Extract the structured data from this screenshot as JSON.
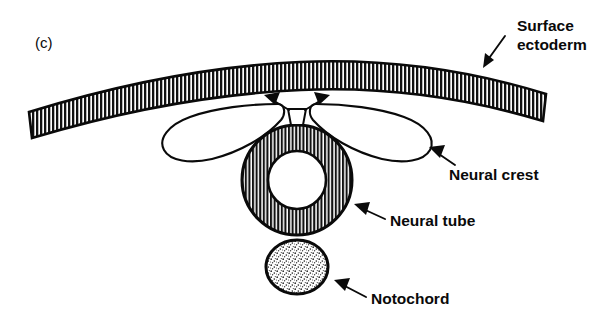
{
  "figure": {
    "panel_label": "(c)",
    "background_color": "#ffffff",
    "ink_color": "#0a0a0a",
    "width": 610,
    "height": 323
  },
  "labels": {
    "surface_ectoderm_line1": "Surface",
    "surface_ectoderm_line2": "ectoderm",
    "neural_crest": "Neural crest",
    "neural_tube": "Neural tube",
    "notochord": "Notochord"
  },
  "structures": {
    "surface_ectoderm": {
      "name": "Surface ectoderm",
      "fill_pattern": "vertical-hatching",
      "description": "Arched band of epithelium spanning the top of the figure"
    },
    "neural_crest": {
      "name": "Neural crest",
      "fill_pattern": "none-white",
      "description": "Two elongated lobes of cells flanking the dorsal neural tube"
    },
    "neural_tube": {
      "name": "Neural tube",
      "fill_pattern": "vertical-hatching",
      "description": "Closed annulus with central lumen"
    },
    "notochord": {
      "name": "Notochord",
      "fill_pattern": "stipple",
      "description": "Stippled ellipse ventral to the neural tube"
    },
    "migration_arrows": {
      "name": "Neural crest migration arrows",
      "count": 2,
      "description": "Paired arrows at the dorsal midline indicating outward cell migration"
    }
  }
}
